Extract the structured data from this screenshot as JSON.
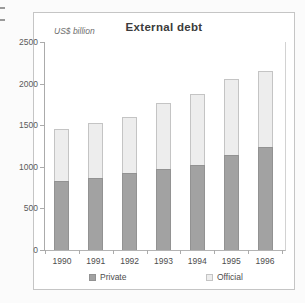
{
  "page": {
    "background": "#fbfbfb"
  },
  "chart_data": {
    "type": "bar",
    "stacked": true,
    "title": "External debt",
    "ylabel": "US$ billion",
    "xlabel": "",
    "categories": [
      "1990",
      "1991",
      "1992",
      "1993",
      "1994",
      "1995",
      "1996"
    ],
    "series": [
      {
        "name": "Private",
        "color": "#a2a2a2",
        "border": "#929292",
        "values": [
          830,
          860,
          920,
          970,
          1020,
          1140,
          1240
        ]
      },
      {
        "name": "Official",
        "color": "#ededed",
        "border": "#c4c4c4",
        "values": [
          630,
          670,
          680,
          800,
          860,
          910,
          910
        ]
      }
    ],
    "totals": [
      1460,
      1530,
      1600,
      1770,
      1880,
      2050,
      2150
    ],
    "ylim": [
      0,
      2500
    ],
    "yticks": [
      0,
      500,
      1000,
      1500,
      2000,
      2500
    ],
    "grid": false,
    "legend_position": "bottom"
  },
  "colors": {
    "axis": "#ababab",
    "box_border": "#c5c5c5",
    "text": "#4d4d4d",
    "title_text": "#3b3b3b"
  }
}
